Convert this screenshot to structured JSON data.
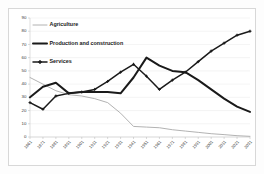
{
  "chart_data": {
    "type": "line",
    "title": "",
    "xlabel": "",
    "ylabel": "",
    "ylim": [
      0,
      90
    ],
    "ytick_values": [
      0,
      10,
      20,
      30,
      40,
      50,
      60,
      70,
      80,
      90
    ],
    "grid": true,
    "legend_position": "top-left",
    "categories": [
      "1861",
      "1871",
      "1881",
      "1891",
      "1901",
      "1911",
      "1921",
      "1931",
      "1941",
      "1951",
      "1961",
      "1971",
      "1981",
      "1991",
      "2001",
      "2011",
      "2021",
      "2031"
    ],
    "series": [
      {
        "name": "Agriculture",
        "color": "#a9a9a9",
        "marker": "none",
        "values": [
          45,
          40,
          35,
          32,
          31,
          29,
          26,
          18,
          8,
          7.5,
          7,
          5.5,
          4.5,
          3.5,
          2.5,
          1.8,
          1,
          0.5
        ]
      },
      {
        "name": "Production and construction",
        "color": "#1a1a1a",
        "marker": "none",
        "values": [
          30,
          38,
          41,
          33,
          34,
          34,
          34,
          33,
          45,
          60,
          54,
          50,
          49,
          43,
          36,
          29,
          23,
          19
        ]
      },
      {
        "name": "Services",
        "color": "#1a1a1a",
        "marker": "cross",
        "values": [
          26,
          21,
          31,
          33,
          34,
          36,
          42,
          49,
          55,
          46,
          36,
          43,
          49,
          57,
          65,
          71,
          77,
          80
        ]
      }
    ]
  },
  "legend": {
    "items": [
      {
        "label": "Agriculture",
        "style": "thin-gray-line"
      },
      {
        "label": "Production and construction",
        "style": "thick-black-line"
      },
      {
        "label": "Services",
        "style": "black-line-cross-markers"
      }
    ]
  },
  "axis": {
    "y_labels": [
      "90",
      "80",
      "70",
      "60",
      "50",
      "40",
      "30",
      "20",
      "10",
      "0"
    ],
    "x_labels": [
      "1861",
      "1871",
      "1881",
      "1891",
      "1901",
      "1911",
      "1921",
      "1931",
      "1941",
      "1951",
      "1961",
      "1971",
      "1981",
      "1991",
      "2001",
      "2011",
      "2021",
      "2031"
    ]
  }
}
